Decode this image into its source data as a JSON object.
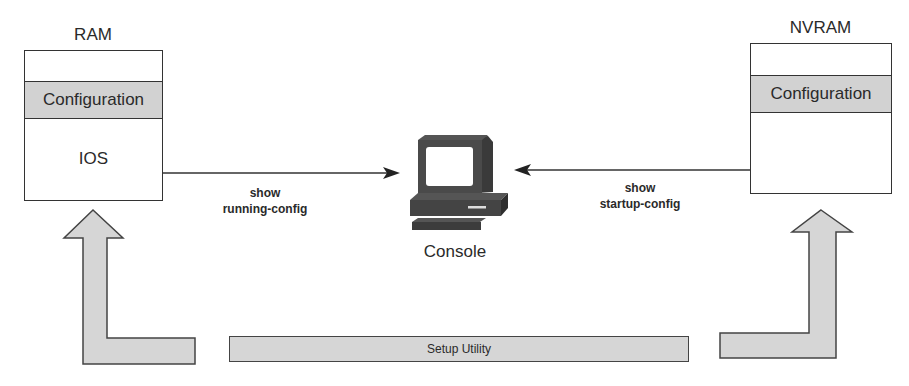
{
  "diagram": {
    "ram": {
      "title": "RAM",
      "sections": {
        "configuration": "Configuration",
        "ios": "IOS"
      }
    },
    "nvram": {
      "title": "NVRAM",
      "sections": {
        "configuration": "Configuration"
      }
    },
    "console": {
      "label": "Console",
      "icon": "computer-terminal-icon"
    },
    "commands": {
      "running": {
        "line1": "show",
        "line2": "running-config"
      },
      "startup": {
        "line1": "show",
        "line2": "startup-config"
      }
    },
    "setup_utility": {
      "label": "Setup Utility"
    },
    "colors": {
      "band_fill": "#d2d2d2",
      "arrow_fill": "#d6d6d6",
      "stroke": "#333333"
    }
  }
}
